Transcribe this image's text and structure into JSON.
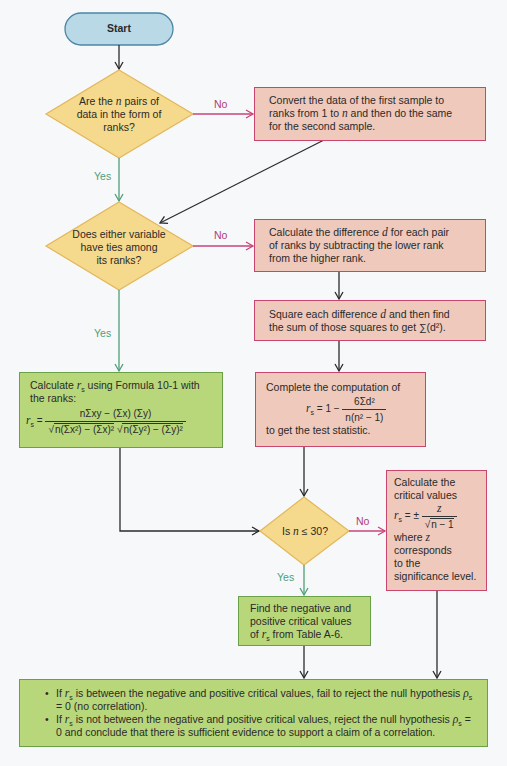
{
  "diagram": {
    "type": "flowchart",
    "colors": {
      "start_fill": "#b9d9e6",
      "start_stroke": "#4a86a6",
      "decision_fill": "#f5d98c",
      "decision_stroke": "#e3b75a",
      "process_pink_fill": "#efc9bc",
      "process_pink_stroke": "#c8456e",
      "process_green_fill": "#b8d77a",
      "process_green_stroke": "#6aa047",
      "no_arrow": "#c8457a",
      "yes_arrow": "#4f9f78",
      "flow_arrow": "#2a2a2a"
    },
    "start": {
      "label": "Start"
    },
    "decision1": {
      "line1_a": "Are the ",
      "line1_var": "n",
      "line1_b": " pairs of",
      "line2": "data in the form of",
      "line3": "ranks?"
    },
    "decision2": {
      "line1": "Does either variable",
      "line2": "have ties among",
      "line3": "its ranks?"
    },
    "decision3": {
      "text_a": "Is ",
      "text_var": "n",
      "text_b": " ≤ 30?"
    },
    "labels": {
      "no": "No",
      "yes": "Yes"
    },
    "box_convert": {
      "line1": "Convert the data of the first sample to",
      "line2_a": "ranks from 1 to ",
      "line2_var": "n",
      "line2_b": " and then do the same",
      "line3": "for the second sample."
    },
    "box_difference": {
      "line1_a": "Calculate the difference ",
      "line1_var": "d",
      "line1_b": " for each pair",
      "line2": "of ranks by subtracting the lower rank",
      "line3": "from the higher rank."
    },
    "box_square": {
      "line1_a": "Square each difference ",
      "line1_var": "d",
      "line1_b": " and then find",
      "line2_a": "the sum of those squares to get ",
      "line2_formula": "∑(d²)."
    },
    "box_formula_10_1": {
      "line1_a": "Calculate ",
      "line1_var": "r",
      "line1_sub": "s",
      "line1_b": " using  Formula 10-1 with",
      "line2": "the ranks:",
      "lhs_var": "r",
      "lhs_sub": "s",
      "equals": "=",
      "numerator": "nΣxy − (Σx) (Σy)",
      "denominator_a": "n(Σx²) − (Σx)²",
      "denominator_b": "n(Σy²) − (Σy)²"
    },
    "box_compute": {
      "line1": "Complete the computation of",
      "lhs_var": "r",
      "lhs_sub": "s",
      "equals_part": "= 1 −",
      "numerator": "6Σd²",
      "denominator": "n(n² − 1)",
      "line3": "to get the test statistic."
    },
    "box_table": {
      "line1": "Find the negative and",
      "line2": "positive  critical values",
      "line3_a": "of ",
      "line3_var": "r",
      "line3_sub": "s",
      "line3_b": " from  Table A-6."
    },
    "box_critical": {
      "line1": "Calculate the",
      "line2": "critical values",
      "lhs_var": "r",
      "lhs_sub": "s",
      "equals_part": "= ±",
      "numerator": "z",
      "denominator": "n − 1",
      "line4_a": "where ",
      "line4_var": "z",
      "line5": "corresponds",
      "line6": "to the",
      "line7": "significance level."
    },
    "box_conclusion": {
      "bullets": [
        {
          "a": "If ",
          "var": "r",
          "sub": "s",
          "b": " is between the negative and positive critical values, fail to reject the null hypothesis ",
          "rho": "ρ",
          "rho_sub": "s",
          "c": " = 0 (no correlation)."
        },
        {
          "a": "If ",
          "var": "r",
          "sub": "s",
          "b": " is not between the negative and positive critical values, reject the null hypothesis ",
          "rho": "ρ",
          "rho_sub": "s",
          "c": " = 0 and conclude that there is sufficient evidence to support a claim of a correlation."
        }
      ]
    }
  }
}
